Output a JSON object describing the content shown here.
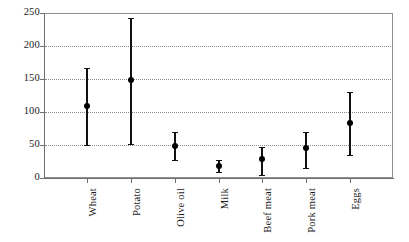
{
  "chart_data": {
    "type": "scatter",
    "title": "",
    "subtitle": "",
    "xlabel": "",
    "ylabel": "",
    "ylim": [
      0,
      250
    ],
    "yticks": [
      0,
      50,
      100,
      150,
      200,
      250
    ],
    "ytick_labels": [
      "0",
      "50",
      "100",
      "150",
      "200",
      "250"
    ],
    "grid": true,
    "grid_axis": "y",
    "grid_style": "dotted",
    "legend": false,
    "legend_position": "none",
    "marker": "filled-circle",
    "error_bar_style": "vertical-line-with-point",
    "categories": [
      "Wheat",
      "Potato",
      "Olive oil",
      "Milk",
      "Beef meat",
      "Pork meat",
      "Eggs"
    ],
    "values": [
      109,
      148,
      48,
      18,
      29,
      45,
      83
    ],
    "error_low": [
      50,
      52,
      27,
      9,
      5,
      15,
      35
    ],
    "error_high": [
      167,
      242,
      70,
      27,
      47,
      70,
      130
    ],
    "points": [
      {
        "category": "Wheat",
        "value": 109,
        "low": 50,
        "high": 167
      },
      {
        "category": "Potato",
        "value": 148,
        "low": 52,
        "high": 242
      },
      {
        "category": "Olive oil",
        "value": 48,
        "low": 27,
        "high": 70
      },
      {
        "category": "Milk",
        "value": 18,
        "low": 9,
        "high": 27
      },
      {
        "category": "Beef meat",
        "value": 29,
        "low": 5,
        "high": 47
      },
      {
        "category": "Pork meat",
        "value": 45,
        "low": 15,
        "high": 70
      },
      {
        "category": "Eggs",
        "value": 83,
        "low": 35,
        "high": 130
      }
    ],
    "colors": {
      "marker": "#000000",
      "error_bar": "#111111",
      "grid": "#8c8c8c",
      "axis": "#6e6e6e",
      "frame": "#8f8f8f",
      "background": "#ffffff",
      "text": "#1a1a1a"
    }
  },
  "layout": {
    "plot_left": 44,
    "plot_top": 13,
    "plot_width": 349,
    "plot_height": 165,
    "x_positions": [
      87,
      131,
      175,
      219,
      262,
      306,
      350
    ]
  }
}
